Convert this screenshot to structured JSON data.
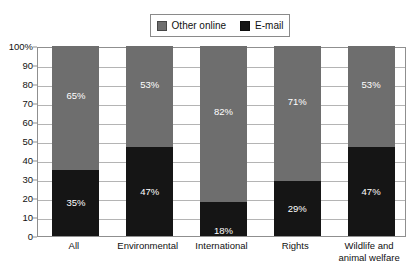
{
  "legend": {
    "entries": [
      {
        "label": "Other online",
        "color": "#6e6e6e",
        "icon": "square-swatch-gray"
      },
      {
        "label": "E-mail",
        "color": "#151515",
        "icon": "square-swatch-black"
      }
    ]
  },
  "axis": {
    "y_ticks": [
      "100%",
      "90",
      "80",
      "70",
      "60",
      "50",
      "40",
      "30",
      "20",
      "10",
      "0"
    ],
    "y_values": [
      100,
      90,
      80,
      70,
      60,
      50,
      40,
      30,
      20,
      10,
      0
    ]
  },
  "chart_data": {
    "type": "bar",
    "title": "",
    "subtitle": "",
    "xlabel": "",
    "ylabel": "",
    "stacked": true,
    "stacked_normalized": true,
    "grid": true,
    "legend_position": "top-center",
    "ylim": [
      0,
      100
    ],
    "ytick_step": 10,
    "categories": [
      "All",
      "Environmental",
      "International",
      "Rights",
      "Wildlife and animal welfare"
    ],
    "series": [
      {
        "name": "E-mail",
        "color": "#151515",
        "values": [
          35,
          47,
          18,
          29,
          47
        ],
        "labels": [
          "35%",
          "47%",
          "18%",
          "29%",
          "47%"
        ]
      },
      {
        "name": "Other online",
        "color": "#6e6e6e",
        "values": [
          65,
          53,
          82,
          71,
          53
        ],
        "labels": [
          "65%",
          "53%",
          "82%",
          "71%",
          "53%"
        ]
      }
    ]
  },
  "category_lines": [
    [
      "All"
    ],
    [
      "Environmental"
    ],
    [
      "International"
    ],
    [
      "Rights"
    ],
    [
      "Wildlife and",
      "animal welfare"
    ]
  ]
}
